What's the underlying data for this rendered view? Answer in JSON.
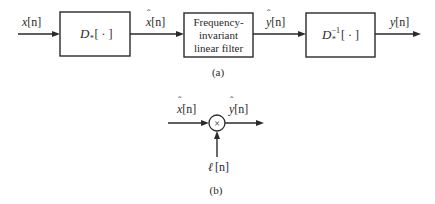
{
  "part_a": {
    "caption": "(a)",
    "input_signal": "x[n]",
    "blocks": [
      {
        "id": "homomorphic-system",
        "label_main": "D",
        "label_sub": "*",
        "label_sup": "",
        "label_arg": "[ · ]"
      },
      {
        "id": "linear-filter",
        "lines": [
          "Frequency-",
          "invariant",
          "linear filter"
        ]
      },
      {
        "id": "inverse-homomorphic-system",
        "label_main": "D",
        "label_sub": "*",
        "label_sup": "−1",
        "label_arg": "[ · ]"
      }
    ],
    "signals": {
      "input": {
        "base": "x",
        "arg": "[n]"
      },
      "after_block1": {
        "base": "x",
        "hat": "ˆ",
        "arg": "[n]"
      },
      "after_block2": {
        "base": "y",
        "hat": "ˆ",
        "arg": "[n]"
      },
      "output": {
        "base": "y",
        "arg": "[n]"
      }
    }
  },
  "part_b": {
    "caption": "(b)",
    "multiplier_symbol": "×",
    "signals": {
      "input": {
        "base": "x",
        "hat": "ˆ",
        "arg": "[n]"
      },
      "output": {
        "base": "y",
        "hat": "ˆ",
        "arg": "[n]"
      },
      "window": {
        "base": "ℓ",
        "arg": "[n]"
      }
    }
  }
}
